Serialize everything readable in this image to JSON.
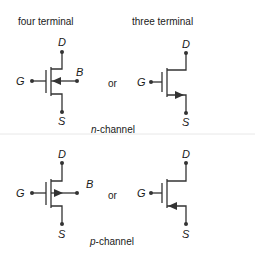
{
  "headers": {
    "four_terminal": "four terminal",
    "three_terminal": "three terminal"
  },
  "connector": "or",
  "sections": [
    {
      "id": "n-channel",
      "caption_prefix": "n",
      "caption_suffix": "-channel",
      "four_terminal": {
        "drain": "D",
        "gate": "G",
        "body": "B",
        "source": "S",
        "body_arrow": "inward"
      },
      "three_terminal": {
        "drain": "D",
        "gate": "G",
        "source": "S",
        "source_arrow": "outward"
      }
    },
    {
      "id": "p-channel",
      "caption_prefix": "p",
      "caption_suffix": "-channel",
      "four_terminal": {
        "drain": "D",
        "gate": "G",
        "body": "B",
        "source": "S",
        "body_arrow": "outward"
      },
      "three_terminal": {
        "drain": "D",
        "gate": "G",
        "source": "S",
        "source_arrow": "inward"
      }
    }
  ],
  "colors": {
    "line": "#333333",
    "text": "#1a1a1a",
    "separator": "#e6e6e6"
  }
}
